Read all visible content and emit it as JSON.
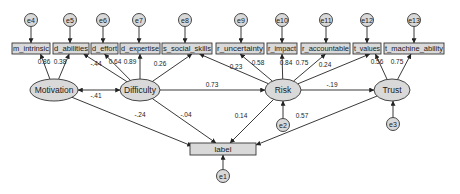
{
  "diagram": {
    "type": "structural-equation-model",
    "colors": {
      "fill": "#d9d9d9",
      "stroke": "#333333",
      "edge": "#222222",
      "background": "#ffffff"
    },
    "indicators": [
      {
        "id": "m_intrinsic",
        "label": "m_intrinsic",
        "x": 12,
        "w": 38,
        "error": "e4",
        "ex": 31
      },
      {
        "id": "d_abilities",
        "label": "d_abilities",
        "x": 53,
        "w": 36,
        "error": "e5",
        "ex": 70
      },
      {
        "id": "d_effort",
        "label": "d_effort",
        "x": 91,
        "w": 27,
        "error": "e6",
        "ex": 103
      },
      {
        "id": "d_expertise",
        "label": "d_expertise",
        "x": 120,
        "w": 40,
        "error": "e7",
        "ex": 139
      },
      {
        "id": "s_social_skills",
        "label": "s_social_skills",
        "x": 162,
        "w": 50,
        "error": "e8",
        "ex": 185
      },
      {
        "id": "r_uncertainty",
        "label": "r_uncertainty",
        "x": 216,
        "w": 48,
        "error": "e9",
        "ex": 241
      },
      {
        "id": "r_impact",
        "label": "r_impact",
        "x": 267,
        "w": 30,
        "error": "e10",
        "ex": 282
      },
      {
        "id": "r_accountable",
        "label": "r_accountable",
        "x": 301,
        "w": 49,
        "error": "e11",
        "ex": 326
      },
      {
        "id": "t_values",
        "label": "t_values",
        "x": 353,
        "w": 28,
        "error": "e12",
        "ex": 367
      },
      {
        "id": "t_machine_ability",
        "label": "t_machine_ability",
        "x": 384,
        "w": 60,
        "error": "e13",
        "ex": 414
      }
    ],
    "latents": [
      {
        "id": "Motivation",
        "label": "Motivation",
        "cx": 54,
        "cy": 90,
        "rx": 24,
        "ry": 11
      },
      {
        "id": "Difficulty",
        "label": "Difficulty",
        "cx": 140,
        "cy": 90,
        "rx": 20,
        "ry": 11
      },
      {
        "id": "Risk",
        "label": "Risk",
        "cx": 283,
        "cy": 90,
        "rx": 18,
        "ry": 11
      },
      {
        "id": "Trust",
        "label": "Trust",
        "cx": 392,
        "cy": 90,
        "rx": 18,
        "ry": 11
      }
    ],
    "outcome": {
      "id": "label",
      "label": "label",
      "x": 190,
      "y": 143,
      "w": 66,
      "h": 12,
      "error": "e1"
    },
    "latent_errors": [
      {
        "id": "e2",
        "label": "e2",
        "cx": 283,
        "cy": 125,
        "target": "Risk"
      },
      {
        "id": "e3",
        "label": "e3",
        "cx": 393,
        "cy": 124,
        "target": "Trust"
      },
      {
        "id": "e1",
        "label": "e1",
        "cx": 223,
        "cy": 176,
        "target": "label"
      }
    ],
    "loadings": [
      {
        "from": "Motivation",
        "to": "m_intrinsic",
        "value": "0.86",
        "lx": 44,
        "ly": 64
      },
      {
        "from": "Motivation",
        "to": "d_abilities",
        "value": "0.38",
        "lx": 60,
        "ly": 64
      },
      {
        "from": "Difficulty",
        "to": "d_abilities",
        "value": "-.44",
        "lx": 96,
        "ly": 66
      },
      {
        "from": "Difficulty",
        "to": "d_effort",
        "value": "0.64",
        "lx": 115,
        "ly": 64
      },
      {
        "from": "Difficulty",
        "to": "d_expertise",
        "value": "0.89",
        "lx": 130,
        "ly": 64
      },
      {
        "from": "Difficulty",
        "to": "s_social_skills",
        "value": "0.26",
        "lx": 160,
        "ly": 66
      },
      {
        "from": "Risk",
        "to": "s_social_skills",
        "value": "0.23",
        "lx": 236,
        "ly": 69
      },
      {
        "from": "Risk",
        "to": "r_uncertainty",
        "value": "0.58",
        "lx": 258,
        "ly": 65
      },
      {
        "from": "Risk",
        "to": "r_impact",
        "value": "0.84",
        "lx": 286,
        "ly": 65
      },
      {
        "from": "Risk",
        "to": "r_accountable",
        "value": "0.75",
        "lx": 302,
        "ly": 65
      },
      {
        "from": "Risk",
        "to": "t_values",
        "value": "0.24",
        "lx": 325,
        "ly": 67
      },
      {
        "from": "Trust",
        "to": "t_values",
        "value": "0.56",
        "lx": 377,
        "ly": 64
      },
      {
        "from": "Trust",
        "to": "t_machine_ability",
        "value": "0.75",
        "lx": 397,
        "ly": 64
      }
    ],
    "paths": [
      {
        "from": "Motivation",
        "to": "Difficulty",
        "value": "-.41",
        "type": "covariance",
        "lx": 96,
        "ly": 98
      },
      {
        "from": "Difficulty",
        "to": "Risk",
        "value": "0.73",
        "lx": 212,
        "ly": 87
      },
      {
        "from": "Risk",
        "to": "Trust",
        "value": "-.19",
        "lx": 332,
        "ly": 87
      },
      {
        "from": "Motivation",
        "to": "label",
        "value": "-.24",
        "lx": 140,
        "ly": 117
      },
      {
        "from": "Difficulty",
        "to": "label",
        "value": "-.04",
        "lx": 186,
        "ly": 117
      },
      {
        "from": "Risk",
        "to": "label",
        "value": "0.14",
        "lx": 241,
        "ly": 118
      },
      {
        "from": "Trust",
        "to": "label",
        "value": "0.57",
        "lx": 302,
        "ly": 118
      }
    ]
  }
}
